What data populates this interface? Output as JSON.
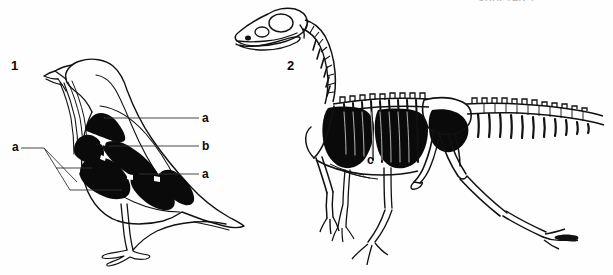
{
  "figure": {
    "background_color": "#fefefe",
    "ink_color": "#0a0a0a",
    "line_color": "#2a2a2a",
    "width": 613,
    "height": 275,
    "cropped_header_text": "CHAPTER 4"
  },
  "panels": [
    {
      "number": "1",
      "name": "bird-air-sacs",
      "number_position": {
        "x": 12,
        "y": 60
      }
    },
    {
      "number": "2",
      "name": "theropod-skeleton",
      "number_position": {
        "x": 288,
        "y": 60
      }
    }
  ],
  "labels": [
    {
      "id": "label-a-top-right",
      "text": "a",
      "x": 203,
      "y": 111,
      "leader": {
        "x1": 200,
        "y1": 118,
        "x2": 106,
        "y2": 118
      }
    },
    {
      "id": "label-b-right",
      "text": "b",
      "x": 203,
      "y": 139,
      "leader": {
        "x1": 200,
        "y1": 146,
        "x2": 110,
        "y2": 146
      }
    },
    {
      "id": "label-a-lower-right",
      "text": "a",
      "x": 203,
      "y": 167,
      "leader": {
        "x1": 200,
        "y1": 174,
        "x2": 140,
        "y2": 174
      }
    },
    {
      "id": "label-a-left",
      "text": "a",
      "x": 13,
      "y": 140,
      "leader": {
        "x1": 20,
        "y1": 148,
        "x2": 122,
        "y2": 148
      }
    },
    {
      "id": "label-c-skeleton",
      "text": "c",
      "x": 368,
      "y": 155,
      "leader": null
    }
  ],
  "legend_keys": {
    "a": "abdominal and cervical air sacs",
    "b": "lung",
    "c": "air sac cavity in theropod trunk"
  }
}
